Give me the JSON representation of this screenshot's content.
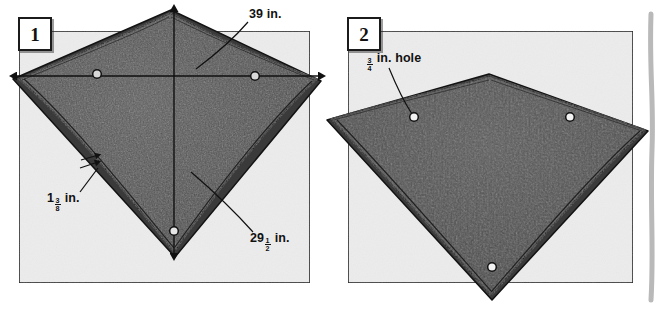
{
  "figure": {
    "width": 660,
    "height": 310,
    "page_background": "#ffffff",
    "board_background": "#ececec",
    "board_border": "#1d1d1d",
    "sail_fill": "#515151",
    "sail_fill_dark": "#3f3f3f",
    "sail_edge": "#141414",
    "hole_fill": "#ffffff",
    "hole_stroke": "#111111",
    "dimension_line_color": "#111111",
    "scan_edge_color": "#b9b9b9"
  },
  "panels": [
    {
      "id": "panel-1",
      "badge": "1",
      "name": "front-view-panel",
      "labels": [
        "39 in.",
        "29 1/2 in.",
        "1 3/8 in."
      ],
      "holes": 3
    },
    {
      "id": "panel-2",
      "badge": "2",
      "name": "back-view-panel",
      "labels": [
        "3/4 in. hole"
      ],
      "holes": 3
    }
  ],
  "badges": {
    "one": "1",
    "two": "2"
  },
  "labels": {
    "width_dimension": {
      "text": "39 in.",
      "whole": "39",
      "unit": "in."
    },
    "height_dimension": {
      "whole": "29",
      "numerator": "1",
      "denominator": "2",
      "unit": "in."
    },
    "edge_dimension": {
      "whole": "1",
      "numerator": "3",
      "denominator": "8",
      "unit": "in."
    },
    "hole_dimension": {
      "whole": "",
      "numerator": "3",
      "denominator": "4",
      "unit": "in. hole"
    }
  }
}
